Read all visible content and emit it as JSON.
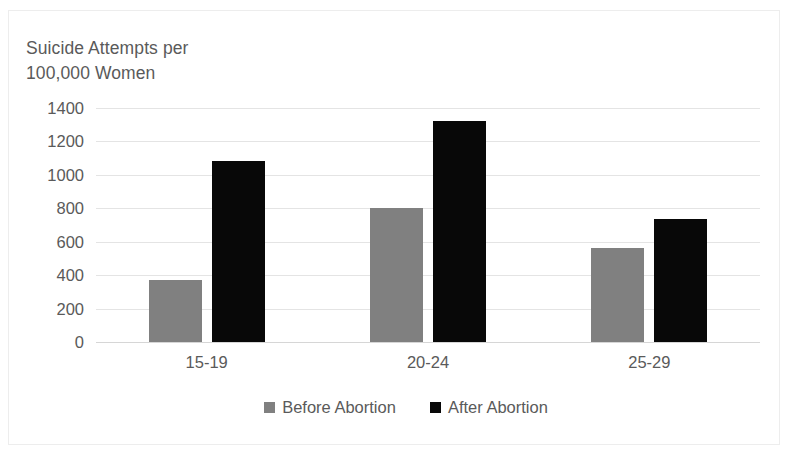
{
  "chart_data": {
    "type": "bar",
    "title": "Suicide Attempts per\n100,000 Women",
    "title_line1": "Suicide Attempts per",
    "title_line2": "100,000 Women",
    "xlabel": "",
    "ylabel": "",
    "categories": [
      "15-19",
      "20-24",
      "25-29"
    ],
    "series": [
      {
        "name": "Before Abortion",
        "color": "#808080",
        "values": [
          370,
          800,
          560
        ]
      },
      {
        "name": "After Abortion",
        "color": "#080808",
        "values": [
          1085,
          1320,
          735
        ]
      }
    ],
    "ylim": [
      0,
      1400
    ],
    "yticks": [
      1400,
      1200,
      1000,
      800,
      600,
      400,
      200,
      0
    ],
    "ytick_labels": [
      "1400",
      "1200",
      "1000",
      "800",
      "600",
      "400",
      "200",
      "0"
    ],
    "grid": true,
    "legend_position": "bottom"
  },
  "style": {
    "text_color": "#5a5a5a",
    "gridline_color": "#e4e4e4",
    "frame_color": "#ededed",
    "background": "#ffffff"
  }
}
